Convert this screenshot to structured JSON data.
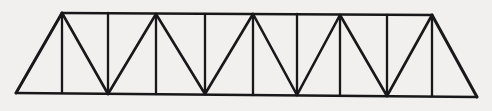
{
  "figure": {
    "kind": "line-diagram",
    "background_color": "#f1f0ee",
    "line_color": "#18181a",
    "canvas": {
      "width": 492,
      "height": 111
    }
  },
  "geometry": {
    "description": "Warren-with-verticals style truss. Horizontal top chord and bottom chord joined by vertical posts at every panel point and zig-zag diagonals; the two outer panels are plain sloping end triangles.",
    "top_chord": {
      "x_start": 62,
      "y_start": 13,
      "x_end": 432,
      "y_end": 15
    },
    "bottom_chord": {
      "x_start": 16,
      "y_start": 93,
      "x_end": 477,
      "y_end": 97
    },
    "top_nodes": [
      {
        "id": "T0",
        "x": 62,
        "y": 13,
        "apex": true
      },
      {
        "id": "T1",
        "x": 108,
        "y": 13,
        "apex": false
      },
      {
        "id": "T2",
        "x": 156,
        "y": 14,
        "apex": true
      },
      {
        "id": "T3",
        "x": 205,
        "y": 14,
        "apex": false
      },
      {
        "id": "T4",
        "x": 253,
        "y": 14,
        "apex": true
      },
      {
        "id": "T5",
        "x": 297,
        "y": 14,
        "apex": false
      },
      {
        "id": "T6",
        "x": 340,
        "y": 15,
        "apex": true
      },
      {
        "id": "T7",
        "x": 387,
        "y": 15,
        "apex": false
      },
      {
        "id": "T8",
        "x": 432,
        "y": 15,
        "apex": true
      }
    ],
    "bottom_nodes": [
      {
        "id": "B-L",
        "x": 16,
        "y": 93,
        "end": true
      },
      {
        "id": "B0",
        "x": 62,
        "y": 93,
        "apex": false
      },
      {
        "id": "B1",
        "x": 108,
        "y": 94,
        "apex": true
      },
      {
        "id": "B2",
        "x": 156,
        "y": 94,
        "apex": false
      },
      {
        "id": "B3",
        "x": 205,
        "y": 94,
        "apex": true
      },
      {
        "id": "B4",
        "x": 253,
        "y": 95,
        "apex": false
      },
      {
        "id": "B5",
        "x": 297,
        "y": 95,
        "apex": true
      },
      {
        "id": "B6",
        "x": 340,
        "y": 95,
        "apex": false
      },
      {
        "id": "B7",
        "x": 387,
        "y": 96,
        "apex": true
      },
      {
        "id": "B8",
        "x": 432,
        "y": 96,
        "apex": false
      },
      {
        "id": "B-R",
        "x": 477,
        "y": 97,
        "end": true
      }
    ],
    "verticals": [
      {
        "id": "V0",
        "x_top": 62,
        "y_top": 13,
        "x_bottom": 62,
        "y_bottom": 93
      },
      {
        "id": "V1",
        "x_top": 108,
        "y_top": 13,
        "x_bottom": 108,
        "y_bottom": 94
      },
      {
        "id": "V2",
        "x_top": 156,
        "y_top": 14,
        "x_bottom": 156,
        "y_bottom": 94
      },
      {
        "id": "V3",
        "x_top": 205,
        "y_top": 14,
        "x_bottom": 205,
        "y_bottom": 94
      },
      {
        "id": "V4",
        "x_top": 253,
        "y_top": 14,
        "x_bottom": 253,
        "y_bottom": 95
      },
      {
        "id": "V5",
        "x_top": 297,
        "y_top": 14,
        "x_bottom": 297,
        "y_bottom": 95
      },
      {
        "id": "V6",
        "x_top": 340,
        "y_top": 15,
        "x_bottom": 340,
        "y_bottom": 95
      },
      {
        "id": "V7",
        "x_top": 387,
        "y_top": 15,
        "x_bottom": 387,
        "y_bottom": 96
      },
      {
        "id": "V8",
        "x_top": 432,
        "y_top": 15,
        "x_bottom": 432,
        "y_bottom": 96
      }
    ],
    "diagonals": [
      {
        "id": "D1",
        "x1": 62,
        "y1": 13,
        "x2": 108,
        "y2": 94,
        "slope": "down-right"
      },
      {
        "id": "D2",
        "x1": 108,
        "y1": 94,
        "x2": 156,
        "y2": 14,
        "slope": "up-right"
      },
      {
        "id": "D3",
        "x1": 156,
        "y1": 14,
        "x2": 205,
        "y2": 94,
        "slope": "down-right"
      },
      {
        "id": "D4",
        "x1": 205,
        "y1": 94,
        "x2": 253,
        "y2": 14,
        "slope": "up-right"
      },
      {
        "id": "D5",
        "x1": 253,
        "y1": 14,
        "x2": 297,
        "y2": 95,
        "slope": "down-right"
      },
      {
        "id": "D6",
        "x1": 297,
        "y1": 95,
        "x2": 340,
        "y2": 15,
        "slope": "up-right"
      },
      {
        "id": "D7",
        "x1": 340,
        "y1": 15,
        "x2": 387,
        "y2": 96,
        "slope": "down-right"
      },
      {
        "id": "D8",
        "x1": 387,
        "y1": 96,
        "x2": 432,
        "y2": 15,
        "slope": "up-right"
      }
    ],
    "end_diagonals": [
      {
        "id": "EL",
        "x1": 16,
        "y1": 93,
        "x2": 62,
        "y2": 13,
        "side": "left"
      },
      {
        "id": "ER",
        "x1": 432,
        "y1": 15,
        "x2": 477,
        "y2": 97,
        "side": "right"
      }
    ],
    "counts": {
      "panels": 10,
      "verticals": 9,
      "diagonals": 8,
      "end_diagonals": 2,
      "top_nodes": 9,
      "bottom_nodes": 11
    }
  }
}
